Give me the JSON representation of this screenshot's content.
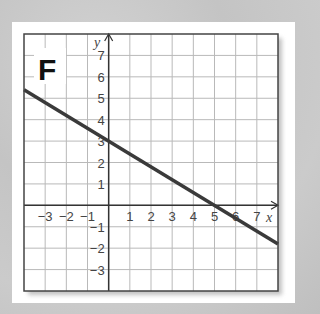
{
  "panel_label": "F",
  "chart_data": {
    "type": "line",
    "title": "F",
    "xlabel": "x",
    "ylabel": "y",
    "xlim": [
      -4,
      8
    ],
    "ylim": [
      -4,
      8
    ],
    "grid": true,
    "x_tick_labels": [
      "-3",
      "-2",
      "-1",
      "1",
      "2",
      "3",
      "4",
      "5",
      "6",
      "7"
    ],
    "y_tick_labels": [
      "7",
      "6",
      "5",
      "4",
      "3",
      "2",
      "1",
      "-1",
      "-2",
      "-3"
    ],
    "series": [
      {
        "name": "line",
        "equation": "y = -0.6x + 3",
        "slope": -0.6,
        "intercept": 3,
        "x": [
          -4,
          0,
          5,
          8
        ],
        "y": [
          5.4,
          3,
          0,
          -1.8
        ],
        "color": "#3a3a3a"
      }
    ]
  },
  "colors": {
    "grid": "#b9b9b9",
    "axis": "#333333",
    "border": "#444444",
    "line": "#3a3a3a"
  }
}
